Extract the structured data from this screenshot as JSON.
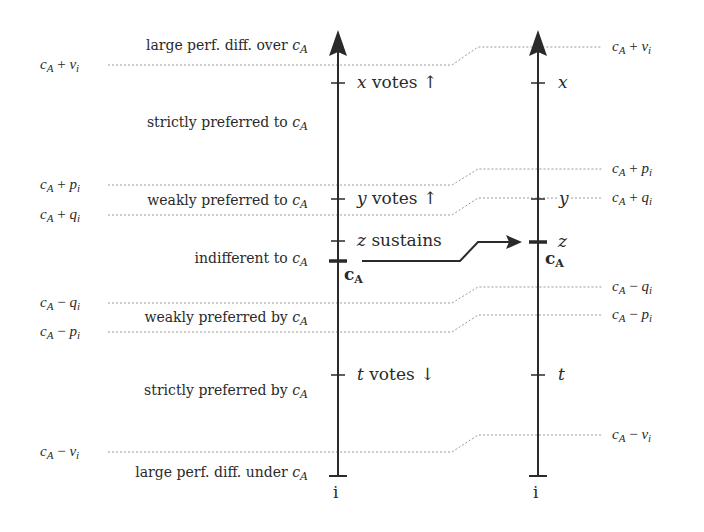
{
  "left_scale": {
    "axis_label": "i",
    "thresholds": [
      {
        "id": "plus_v",
        "base": "c",
        "sub": "A",
        "op": "+",
        "var": "v",
        "var_sub": "i",
        "y": 65
      },
      {
        "id": "plus_p",
        "base": "c",
        "sub": "A",
        "op": "+",
        "var": "p",
        "var_sub": "i",
        "y": 185
      },
      {
        "id": "plus_q",
        "base": "c",
        "sub": "A",
        "op": "+",
        "var": "q",
        "var_sub": "i",
        "y": 215
      },
      {
        "id": "minus_q",
        "base": "c",
        "sub": "A",
        "op": "−",
        "var": "q",
        "var_sub": "i",
        "y": 303
      },
      {
        "id": "minus_p",
        "base": "c",
        "sub": "A",
        "op": "−",
        "var": "p",
        "var_sub": "i",
        "y": 332
      },
      {
        "id": "minus_v",
        "base": "c",
        "sub": "A",
        "op": "−",
        "var": "v",
        "var_sub": "i",
        "y": 452
      }
    ],
    "regions": [
      {
        "text": "large perf. diff. over",
        "ref": "c",
        "ref_sub": "A",
        "y": 47
      },
      {
        "text": "strictly preferred to",
        "ref": "c",
        "ref_sub": "A",
        "y": 124
      },
      {
        "text": "weakly preferred to",
        "ref": "c",
        "ref_sub": "A",
        "y": 202
      },
      {
        "text": "indifferent to",
        "ref": "c",
        "ref_sub": "A",
        "y": 260
      },
      {
        "text": "weakly preferred by",
        "ref": "c",
        "ref_sub": "A",
        "y": 319
      },
      {
        "text": "strictly preferred by",
        "ref": "c",
        "ref_sub": "A",
        "y": 392
      },
      {
        "text": "large perf. diff. under",
        "ref": "c",
        "ref_sub": "A",
        "y": 474
      }
    ],
    "ticks": [
      {
        "var": "x",
        "note": "votes",
        "arrow": "↑",
        "y": 83
      },
      {
        "var": "y",
        "note": "votes",
        "arrow": "↑",
        "y": 199
      },
      {
        "var": "z",
        "note": "sustains",
        "arrow": "",
        "y": 241
      },
      {
        "var": "t",
        "note": "votes",
        "arrow": "↓",
        "y": 375
      }
    ],
    "reference": {
      "label": "c",
      "label_sub": "A",
      "y": 261
    }
  },
  "right_scale": {
    "axis_label": "i",
    "thresholds": [
      {
        "id": "plus_v",
        "base": "c",
        "sub": "A",
        "op": "+",
        "var": "v",
        "var_sub": "i",
        "y": 47
      },
      {
        "id": "plus_p",
        "base": "c",
        "sub": "A",
        "op": "+",
        "var": "p",
        "var_sub": "i",
        "y": 169
      },
      {
        "id": "plus_q",
        "base": "c",
        "sub": "A",
        "op": "+",
        "var": "q",
        "var_sub": "i",
        "y": 198
      },
      {
        "id": "minus_q",
        "base": "c",
        "sub": "A",
        "op": "−",
        "var": "q",
        "var_sub": "i",
        "y": 287
      },
      {
        "id": "minus_p",
        "base": "c",
        "sub": "A",
        "op": "−",
        "var": "p",
        "var_sub": "i",
        "y": 315
      },
      {
        "id": "minus_v",
        "base": "c",
        "sub": "A",
        "op": "−",
        "var": "v",
        "var_sub": "i",
        "y": 435
      }
    ],
    "ticks": [
      {
        "var": "x",
        "y": 83
      },
      {
        "var": "y",
        "y": 199
      },
      {
        "var": "t",
        "y": 375
      }
    ],
    "reference": {
      "tick_var": "z",
      "label": "c",
      "label_sub": "A",
      "y": 242
    }
  },
  "transfer_arrow": {
    "from": "left reference c_A",
    "to": "right reference c_A"
  },
  "colors": {
    "line": "#2a2a2a",
    "dotted": "#9a9a9a",
    "text": "#2a2a2a"
  }
}
